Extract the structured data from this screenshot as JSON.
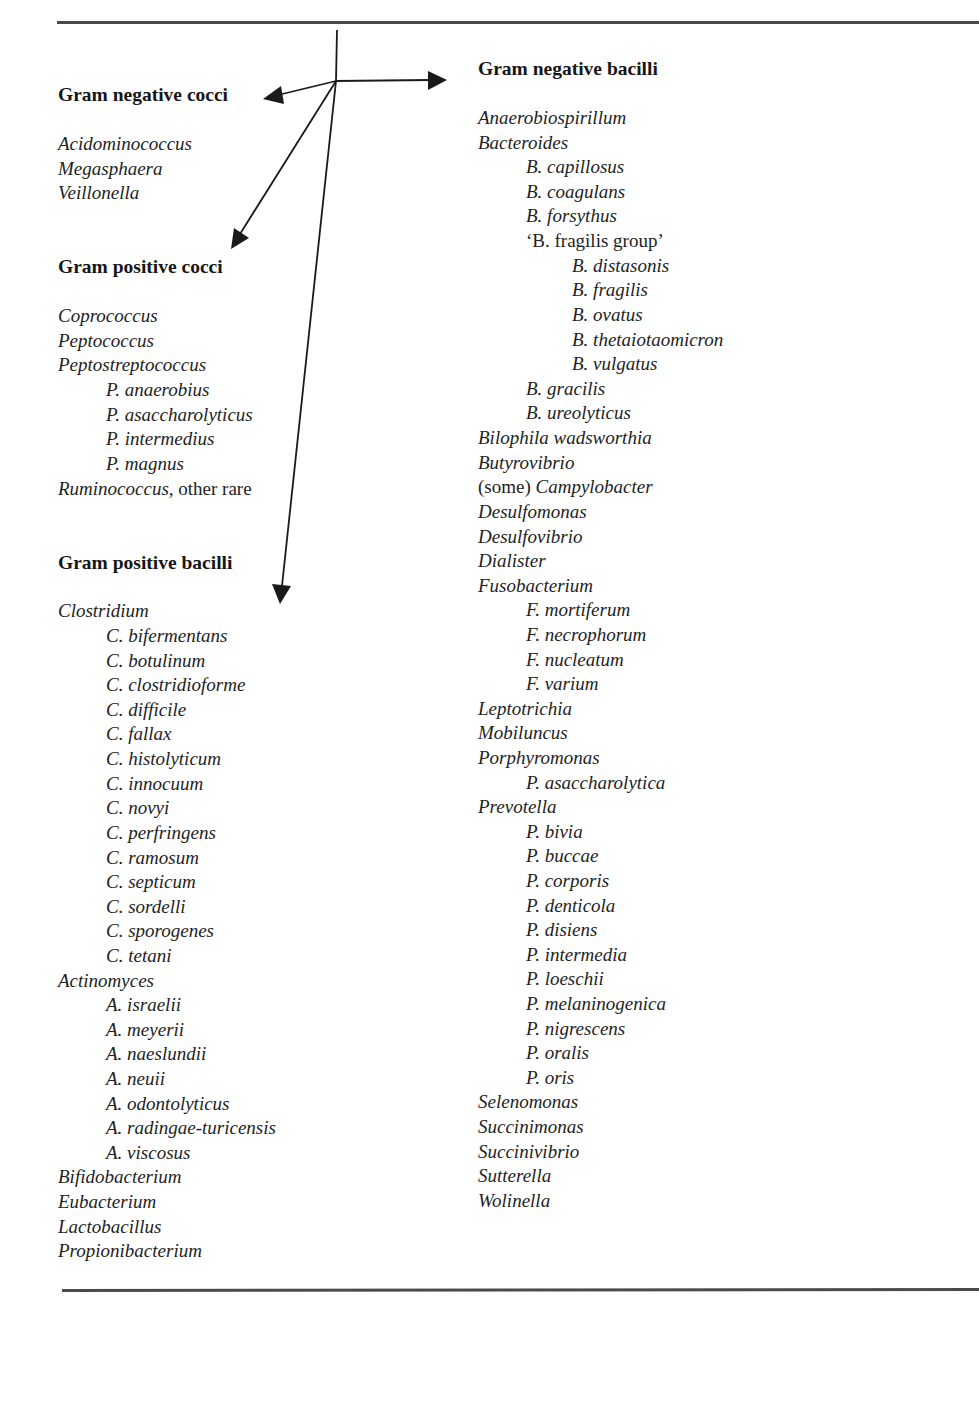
{
  "colors": {
    "text": "#1e1e1e",
    "rule": "#4a4a4a",
    "arrow": "#1a1a1a"
  },
  "diagram": {
    "hub": [
      336,
      81
    ],
    "stem_top": [
      337,
      30
    ],
    "arrows": [
      {
        "target": "Gram negative bacilli",
        "tip": [
          447,
          80
        ]
      },
      {
        "target": "Gram negative cocci",
        "tip": [
          263,
          98
        ]
      },
      {
        "target": "Gram positive cocci",
        "tip": [
          231,
          248
        ]
      },
      {
        "target": "Gram positive bacilli",
        "tip": [
          280,
          603
        ]
      }
    ]
  },
  "left": {
    "gram_negative_cocci": {
      "heading": "Gram negative cocci",
      "items": [
        {
          "text": "Acidominococcus",
          "level": 0
        },
        {
          "text": "Megasphaera",
          "level": 0
        },
        {
          "text": "Veillonella",
          "level": 0
        }
      ]
    },
    "gram_positive_cocci": {
      "heading": "Gram positive cocci",
      "items": [
        {
          "text": "Coprococcus",
          "level": 0
        },
        {
          "text": "Peptococcus",
          "level": 0
        },
        {
          "text": "Peptostreptococcus",
          "level": 0
        },
        {
          "text": "P. anaerobius",
          "level": 1
        },
        {
          "text": "P. asaccharolyticus",
          "level": 1
        },
        {
          "text": "P. intermedius",
          "level": 1
        },
        {
          "text": "P. magnus",
          "level": 1
        },
        {
          "text": "Ruminococcus",
          "suffix": ", other rare",
          "level": 0
        }
      ]
    },
    "gram_positive_bacilli": {
      "heading": "Gram positive bacilli",
      "items": [
        {
          "text": "Clostridium",
          "level": 0
        },
        {
          "text": "C. bifermentans",
          "level": 1
        },
        {
          "text": "C. botulinum",
          "level": 1
        },
        {
          "text": "C. clostridioforme",
          "level": 1
        },
        {
          "text": "C. difficile",
          "level": 1
        },
        {
          "text": "C. fallax",
          "level": 1
        },
        {
          "text": "C. histolyticum",
          "level": 1
        },
        {
          "text": "C. innocuum",
          "level": 1
        },
        {
          "text": "C. novyi",
          "level": 1
        },
        {
          "text": "C. perfringens",
          "level": 1
        },
        {
          "text": "C. ramosum",
          "level": 1
        },
        {
          "text": "C. septicum",
          "level": 1
        },
        {
          "text": "C. sordelli",
          "level": 1
        },
        {
          "text": "C. sporogenes",
          "level": 1
        },
        {
          "text": "C. tetani",
          "level": 1
        },
        {
          "text": "Actinomyces",
          "level": 0
        },
        {
          "text": "A. israelii",
          "level": 1
        },
        {
          "text": "A. meyerii",
          "level": 1
        },
        {
          "text": "A. naeslundii",
          "level": 1
        },
        {
          "text": "A. neuii",
          "level": 1
        },
        {
          "text": "A. odontolyticus",
          "level": 1
        },
        {
          "text": "A. radingae-turicensis",
          "level": 1
        },
        {
          "text": "A. viscosus",
          "level": 1
        },
        {
          "text": "Bifidobacterium",
          "level": 0
        },
        {
          "text": "Eubacterium",
          "level": 0
        },
        {
          "text": "Lactobacillus",
          "level": 0
        },
        {
          "text": "Propionibacterium",
          "level": 0
        }
      ]
    }
  },
  "right": {
    "gram_negative_bacilli": {
      "heading": "Gram negative bacilli",
      "items": [
        {
          "text": "Anaerobiospirillum",
          "level": 0
        },
        {
          "text": "Bacteroides",
          "level": 0
        },
        {
          "text": "B. capillosus",
          "level": 1
        },
        {
          "text": "B. coagulans",
          "level": 1
        },
        {
          "text": "B. forsythus",
          "level": 1
        },
        {
          "text": "‘B. fragilis group’",
          "level": 1,
          "upright": true
        },
        {
          "text": "B. distasonis",
          "level": 2
        },
        {
          "text": "B. fragilis",
          "level": 2
        },
        {
          "text": "B. ovatus",
          "level": 2
        },
        {
          "text": "B. thetaiotaomicron",
          "level": 2
        },
        {
          "text": "B. vulgatus",
          "level": 2
        },
        {
          "text": "B. gracilis",
          "level": 1
        },
        {
          "text": "B. ureolyticus",
          "level": 1
        },
        {
          "text": "Bilophila wadsworthia",
          "level": 0
        },
        {
          "text": "Butyrovibrio",
          "level": 0
        },
        {
          "prefix": "(some) ",
          "text": "Campylobacter",
          "level": 0
        },
        {
          "text": "Desulfomonas",
          "level": 0
        },
        {
          "text": "Desulfovibrio",
          "level": 0
        },
        {
          "text": "Dialister",
          "level": 0
        },
        {
          "text": "Fusobacterium",
          "level": 0
        },
        {
          "text": "F. mortiferum",
          "level": 1
        },
        {
          "text": "F. necrophorum",
          "level": 1
        },
        {
          "text": "F. nucleatum",
          "level": 1
        },
        {
          "text": "F. varium",
          "level": 1
        },
        {
          "text": "Leptotrichia",
          "level": 0
        },
        {
          "text": "Mobiluncus",
          "level": 0
        },
        {
          "text": "Porphyromonas",
          "level": 0
        },
        {
          "text": "P. asaccharolytica",
          "level": 1
        },
        {
          "text": "Prevotella",
          "level": 0
        },
        {
          "text": "P. bivia",
          "level": 1
        },
        {
          "text": "P. buccae",
          "level": 1
        },
        {
          "text": "P. corporis",
          "level": 1
        },
        {
          "text": "P. denticola",
          "level": 1
        },
        {
          "text": "P. disiens",
          "level": 1
        },
        {
          "text": "P. intermedia",
          "level": 1
        },
        {
          "text": "P. loeschii",
          "level": 1
        },
        {
          "text": "P. melaninogenica",
          "level": 1
        },
        {
          "text": "P. nigrescens",
          "level": 1
        },
        {
          "text": "P. oralis",
          "level": 1
        },
        {
          "text": "P. oris",
          "level": 1
        },
        {
          "text": "Selenomonas",
          "level": 0
        },
        {
          "text": "Succinimonas",
          "level": 0
        },
        {
          "text": "Succinivibrio",
          "level": 0
        },
        {
          "text": "Sutterella",
          "level": 0
        },
        {
          "text": "Wolinella",
          "level": 0
        }
      ]
    }
  }
}
